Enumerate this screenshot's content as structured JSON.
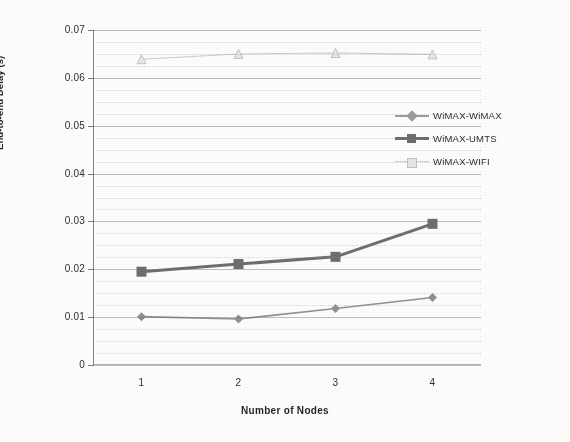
{
  "chart_data": {
    "type": "line",
    "title": "",
    "subtitle": "",
    "xlabel": "Number of Nodes",
    "ylabel": "End-to-end Delay (s)",
    "x": [
      1,
      2,
      3,
      4
    ],
    "categories": [
      "1",
      "2",
      "3",
      "4"
    ],
    "xtick_labels": [
      "1",
      "2",
      "3",
      "4"
    ],
    "ytick_labels": [
      "0",
      "0.01",
      "0.02",
      "0.03",
      "0.04",
      "0.05",
      "0.06",
      "0.07"
    ],
    "ytick_values": [
      0,
      0.01,
      0.02,
      0.03,
      0.04,
      0.05,
      0.06,
      0.07
    ],
    "ylim": [
      0,
      0.07
    ],
    "xlim": [
      0.5,
      4.5
    ],
    "grid": true,
    "grid_style": "horizontal major solid with dotted minor lines",
    "legend_position": "right-inside-upper",
    "series": [
      {
        "name": "WiMAX-WiMAX",
        "marker": "diamond",
        "color": "#8f8f8f",
        "values": [
          0.0101,
          0.0096,
          0.0118,
          0.0141
        ]
      },
      {
        "name": "WiMAX-UMTS",
        "marker": "square",
        "color": "#6b6b6b",
        "values": [
          0.0195,
          0.0211,
          0.0226,
          0.0295
        ]
      },
      {
        "name": "WiMAX-WIFI",
        "marker": "triangle",
        "color": "#c2c2c2",
        "values": [
          0.0639,
          0.065,
          0.0652,
          0.0649
        ]
      }
    ]
  },
  "legend": {
    "items": [
      {
        "label": "WiMAX-WiMAX"
      },
      {
        "label": "WiMAX-UMTS"
      },
      {
        "label": "WiMAX-WIFI"
      }
    ]
  },
  "colors": {
    "series_wimax": "#8f8f8f",
    "series_umts": "#6b6b6b",
    "series_wifi": "#c2c2c2",
    "axis": "#5a5a5a",
    "grid": "#9a9a9a",
    "text": "#2b2b2b",
    "background": "#fdfdfc"
  }
}
